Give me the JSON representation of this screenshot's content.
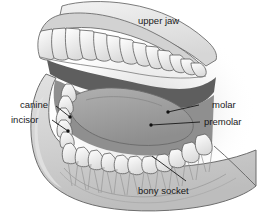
{
  "figure": {
    "background_color": "#ffffff"
  },
  "labels": {
    "upper_jaw": "upper jaw",
    "canine": "canine",
    "incisor": "incisor",
    "molar": "molar",
    "premolar": "premolar",
    "bony_socket": "bony socket"
  },
  "colors": {
    "bone_light": "#d9d9d9",
    "bone_mid": "#c6c6c6",
    "bone_shade": "#b4b4b4",
    "tooth_white": "#fbfbfb",
    "tooth_shade": "#e6e6e6",
    "gum_dark": "#8f8f8f",
    "cavity_dark": "#5e5e5e",
    "tongue": "#9d9d9d",
    "outline": "#4a4a4a",
    "text": "#1a1a1a",
    "leader": "#111111"
  },
  "anatomy": {
    "parts": [
      "upper jaw arch",
      "upper teeth row",
      "oral cavity",
      "tongue",
      "lower jaw bone",
      "lower teeth row",
      "tooth roots in bony sockets"
    ]
  }
}
